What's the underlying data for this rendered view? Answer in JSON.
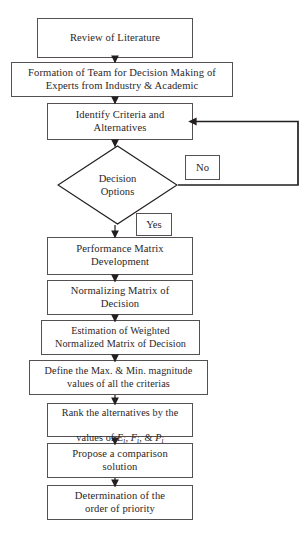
{
  "diagram": {
    "type": "flowchart",
    "orientation": "top-to-bottom",
    "nodes": [
      {
        "id": "review",
        "shape": "process",
        "label": "Review of Literature"
      },
      {
        "id": "formation",
        "shape": "process",
        "label": "Formation of Team for Decision Making of\nExperts from Industry & Academic"
      },
      {
        "id": "identify",
        "shape": "process",
        "label": "Identify Criteria and\nAlternatives"
      },
      {
        "id": "decision",
        "shape": "decision",
        "label": "Decision\nOptions"
      },
      {
        "id": "performance",
        "shape": "process",
        "label": "Performance Matrix\nDevelopment"
      },
      {
        "id": "normalizing",
        "shape": "process",
        "label": "Normalizing Matrix of\nDecision"
      },
      {
        "id": "estimation",
        "shape": "process",
        "label": "Estimation of Weighted\nNormalized Matrix of Decision"
      },
      {
        "id": "define",
        "shape": "process",
        "label": "Define the Max. & Min. magnitude\nvalues of all the criterias"
      },
      {
        "id": "rank",
        "shape": "process",
        "label": "Rank the alternatives by the\nvalues of Ei, Fi, & Pi",
        "label_line1": "Rank the alternatives by the",
        "label_line2_prefix": "values of ",
        "vars": [
          "E",
          "F",
          "P"
        ],
        "var_subscript": "i",
        "label_line2_suffix": ""
      },
      {
        "id": "propose",
        "shape": "process",
        "label": "Propose a comparison\nsolution"
      },
      {
        "id": "determination",
        "shape": "process",
        "label": "Determination of the\norder of priority"
      }
    ],
    "edge_labels": {
      "no": "No",
      "yes": "Yes"
    },
    "edges": [
      {
        "from": "review",
        "to": "formation",
        "label": ""
      },
      {
        "from": "formation",
        "to": "identify",
        "label": ""
      },
      {
        "from": "identify",
        "to": "decision",
        "label": ""
      },
      {
        "from": "decision",
        "to": "identify",
        "label": "No",
        "route": "right-loop-back"
      },
      {
        "from": "decision",
        "to": "performance",
        "label": "Yes"
      },
      {
        "from": "performance",
        "to": "normalizing",
        "label": ""
      },
      {
        "from": "normalizing",
        "to": "estimation",
        "label": ""
      },
      {
        "from": "estimation",
        "to": "define",
        "label": ""
      },
      {
        "from": "define",
        "to": "rank",
        "label": ""
      },
      {
        "from": "rank",
        "to": "propose",
        "label": ""
      },
      {
        "from": "propose",
        "to": "determination",
        "label": ""
      }
    ],
    "colors": {
      "background": "#ffffff",
      "node_border": "#555152",
      "node_fill": "#ffffff",
      "text": "#2b2627",
      "connector": "#231f20"
    }
  }
}
